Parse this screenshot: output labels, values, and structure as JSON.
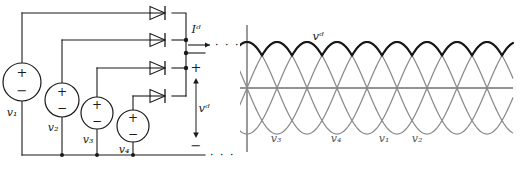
{
  "figure": {
    "type": "circuit-and-waveform"
  },
  "circuit": {
    "sources": [
      {
        "id": "v1",
        "label": "v₁",
        "plus": "+",
        "minus": "−"
      },
      {
        "id": "v2",
        "label": "v₂",
        "plus": "+",
        "minus": "−"
      },
      {
        "id": "v3",
        "label": "v₃",
        "plus": "+",
        "minus": "−"
      },
      {
        "id": "v4",
        "label": "v₄",
        "plus": "+",
        "minus": "−"
      }
    ],
    "diode_count": 4,
    "output": {
      "current_label": "Iᵈ",
      "voltage_label": "vᵈ",
      "terminal_plus": "+",
      "terminal_minus": "−",
      "continuation": "· · ·"
    }
  },
  "plot": {
    "bold_label": "vᵈ",
    "wave_labels": [
      "v₃",
      "v₄",
      "v₁",
      "v₂"
    ],
    "colors": {
      "sine": "#8a8a8a",
      "envelope": "#171717",
      "axis": "#6f6f6f",
      "wire": "#1a1a1a"
    }
  },
  "chart_data": {
    "type": "line",
    "title": "",
    "xlabel": "",
    "ylabel": "",
    "xlim": [
      0,
      2.25
    ],
    "ylim": [
      -1.15,
      1.15
    ],
    "grid": false,
    "legend_position": "inline-annotations",
    "x_unit": "periods",
    "series": [
      {
        "name": "v₃",
        "phase_deg": 0,
        "amplitude": 1.0,
        "color": "#8a8a8a",
        "style": "thin"
      },
      {
        "name": "v₄",
        "phase_deg": 90,
        "amplitude": 1.0,
        "color": "#8a8a8a",
        "style": "thin"
      },
      {
        "name": "v₁",
        "phase_deg": 180,
        "amplitude": 1.0,
        "color": "#8a8a8a",
        "style": "thin"
      },
      {
        "name": "v₂",
        "phase_deg": 270,
        "amplitude": 1.0,
        "color": "#8a8a8a",
        "style": "thin"
      },
      {
        "name": "vᵈ",
        "amplitude": 1.0,
        "color": "#171717",
        "style": "bold",
        "definition": "max(v₁,v₂,v₃,v₄)",
        "ripple_peak": 1.0,
        "ripple_min": 0.707,
        "pulses_per_period": 4
      }
    ]
  }
}
